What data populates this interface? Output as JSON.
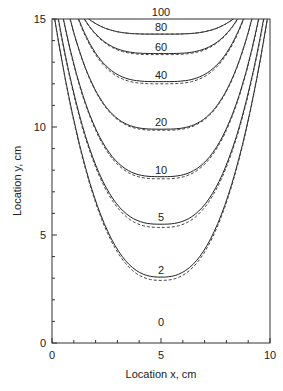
{
  "chart_data": {
    "type": "line",
    "title": "",
    "xlabel": "Location x, cm",
    "ylabel": "Location y, cm",
    "xlim": [
      0,
      10
    ],
    "ylim": [
      0,
      15
    ],
    "x_ticks": [
      0,
      5,
      10
    ],
    "y_ticks": [
      0,
      5,
      10,
      15
    ],
    "x_minor_step": 1,
    "y_minor_step": 1,
    "grid": false,
    "legend": null,
    "series": [
      {
        "name": "solid",
        "style": "solid"
      },
      {
        "name": "dashed",
        "style": "dashed"
      }
    ],
    "contours": [
      {
        "label": "100",
        "level": 100,
        "y_min_solid": 15.0,
        "y_min_dashed": 15.0
      },
      {
        "label": "80",
        "level": 80,
        "y_min_solid": 14.3,
        "y_min_dashed": 14.3
      },
      {
        "label": "60",
        "level": 60,
        "y_min_solid": 13.4,
        "y_min_dashed": 13.35
      },
      {
        "label": "40",
        "level": 40,
        "y_min_solid": 12.1,
        "y_min_dashed": 12.0
      },
      {
        "label": "20",
        "level": 20,
        "y_min_solid": 9.9,
        "y_min_dashed": 9.85
      },
      {
        "label": "10",
        "level": 10,
        "y_min_solid": 7.7,
        "y_min_dashed": 7.6
      },
      {
        "label": "5",
        "level": 5,
        "y_min_solid": 5.5,
        "y_min_dashed": 5.35
      },
      {
        "label": "2",
        "level": 2,
        "y_min_solid": 3.05,
        "y_min_dashed": 2.9
      },
      {
        "label": "0",
        "level": 0,
        "y_min_solid": 0,
        "y_min_dashed": 0
      }
    ]
  }
}
